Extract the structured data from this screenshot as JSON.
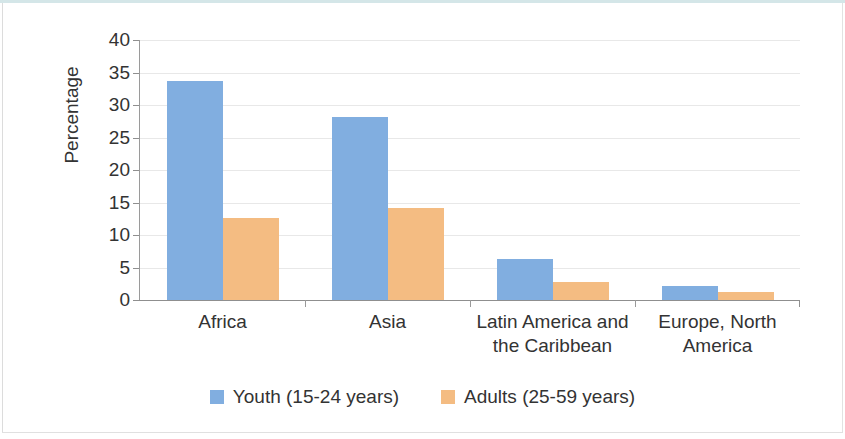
{
  "chart_data": {
    "type": "bar",
    "title": "",
    "xlabel": "",
    "ylabel": "Percentage",
    "ylim": [
      0,
      40
    ],
    "yticks": [
      0,
      5,
      10,
      15,
      20,
      25,
      30,
      35,
      40
    ],
    "ytick_labels": [
      "0",
      "5",
      "10",
      "15",
      "20",
      "25",
      "30",
      "35",
      "40"
    ],
    "grid": true,
    "legend_position": "bottom",
    "categories": [
      "Africa",
      "Asia",
      "Latin America and the Caribbean",
      "Europe, North America"
    ],
    "category_lines": [
      [
        "Africa"
      ],
      [
        "Asia"
      ],
      [
        "Latin America and",
        "the Caribbean"
      ],
      [
        "Europe, North",
        "America"
      ]
    ],
    "series": [
      {
        "name": "Youth (15-24 years)",
        "color": "#81AEE0",
        "values": [
          33.7,
          28.2,
          6.3,
          2.2
        ]
      },
      {
        "name": "Adults (25-59 years)",
        "color": "#F4BC82",
        "values": [
          12.6,
          14.1,
          2.8,
          1.2
        ]
      }
    ]
  },
  "legend": {
    "items": [
      {
        "label": "Youth (15-24 years)",
        "color": "#81AEE0"
      },
      {
        "label": "Adults (25-59 years)",
        "color": "#F4BC82"
      }
    ]
  },
  "axes": {
    "y_title": "Percentage",
    "y_tick_labels": [
      "40",
      "35",
      "30",
      "25",
      "20",
      "15",
      "10",
      "5",
      "0"
    ]
  }
}
